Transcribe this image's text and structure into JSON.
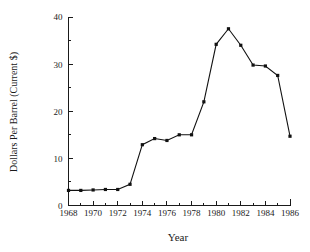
{
  "chart_data": {
    "type": "line",
    "title": "",
    "xlabel": "Year",
    "ylabel": "Dollars Per Barrel (Current $)",
    "x": [
      1968,
      1969,
      1970,
      1971,
      1972,
      1973,
      1974,
      1975,
      1976,
      1977,
      1978,
      1979,
      1980,
      1981,
      1982,
      1983,
      1984,
      1985,
      1986
    ],
    "values": [
      3.2,
      3.2,
      3.3,
      3.4,
      3.4,
      4.5,
      12.9,
      14.2,
      13.8,
      15.0,
      15.0,
      22.0,
      34.2,
      37.5,
      34.0,
      29.8,
      29.6,
      27.6,
      14.7
    ],
    "series": [
      {
        "name": "Dollars Per Barrel (Current $)",
        "values": [
          3.2,
          3.2,
          3.3,
          3.4,
          3.4,
          4.5,
          12.9,
          14.2,
          13.8,
          15.0,
          15.0,
          22.0,
          34.2,
          37.5,
          34.0,
          29.8,
          29.6,
          27.6,
          14.7
        ]
      }
    ],
    "xlim": [
      1968,
      1986
    ],
    "ylim": [
      0,
      40
    ],
    "xticks": [
      1968,
      1970,
      1972,
      1974,
      1976,
      1978,
      1980,
      1982,
      1984,
      1986
    ],
    "xtick_labels": [
      "1968",
      "1970",
      "1972",
      "1974",
      "1976",
      "1978",
      "1980",
      "1982",
      "1984",
      "1986"
    ],
    "yticks": [
      0,
      10,
      20,
      30,
      40
    ],
    "ytick_labels": [
      "0",
      "10",
      "20",
      "30",
      "40"
    ],
    "y_minor_ticks": [
      5,
      15,
      25,
      35
    ],
    "x_minor_ticks": [
      1969,
      1971,
      1973,
      1975,
      1977,
      1979,
      1981,
      1983,
      1985
    ],
    "grid": false,
    "legend": false,
    "legend_position": "none",
    "marker": "square",
    "line_color": "#111111",
    "marker_color": "#111111",
    "background_color": "#ffffff",
    "axis_color": "#1a1a1a"
  }
}
